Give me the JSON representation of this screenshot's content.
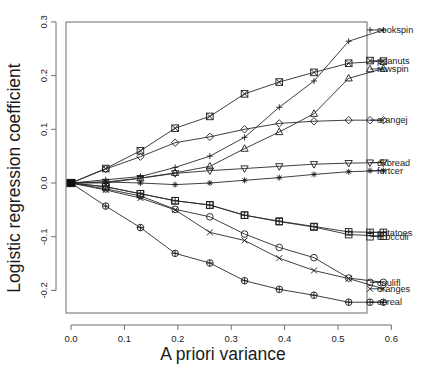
{
  "chart_data": {
    "type": "line",
    "title": "",
    "xlabel": "A priori variance",
    "ylabel": "Logistic regression coefficient",
    "xlim": [
      -0.035,
      0.655
    ],
    "ylim": [
      -0.245,
      0.305
    ],
    "xticks": [
      0.0,
      0.1,
      0.2,
      0.3,
      0.4,
      0.5,
      0.6
    ],
    "xticklabels": [
      "0.0",
      "0.1",
      "0.2",
      "0.3",
      "0.4",
      "0.5",
      "0.6"
    ],
    "yticks": [
      -0.2,
      -0.1,
      0.0,
      0.1,
      0.2,
      0.3
    ],
    "yticklabels": [
      "-0.2",
      "-0.1",
      "0.0",
      "0.1",
      "0.2",
      "0.3"
    ],
    "grid": false,
    "legend_position": "right-inline-labels",
    "x": [
      0.0,
      0.065,
      0.13,
      0.195,
      0.26,
      0.325,
      0.39,
      0.455,
      0.52,
      0.585
    ],
    "series": [
      {
        "name": "cookspin",
        "label": "cookspin",
        "marker": "plus",
        "label_y": 0.285,
        "values": [
          0.0,
          0.006,
          0.012,
          0.029,
          0.05,
          0.085,
          0.141,
          0.19,
          0.264,
          0.285
        ]
      },
      {
        "name": "peanuts",
        "label": "peanuts",
        "marker": "square-x",
        "label_y": 0.228,
        "values": [
          0.0,
          0.027,
          0.06,
          0.102,
          0.124,
          0.166,
          0.188,
          0.206,
          0.223,
          0.227
        ]
      },
      {
        "name": "rawspin",
        "label": "rawspin",
        "marker": "triangle-up",
        "label_y": 0.212,
        "values": [
          0.0,
          0.0,
          0.009,
          0.019,
          0.031,
          0.064,
          0.095,
          0.129,
          0.195,
          0.213
        ]
      },
      {
        "name": "orangej",
        "label": "orangej",
        "marker": "diamond",
        "label_y": 0.117,
        "values": [
          0.0,
          0.026,
          0.049,
          0.075,
          0.086,
          0.1,
          0.111,
          0.115,
          0.117,
          0.117
        ]
      },
      {
        "name": "dkbread",
        "label": "dkbread",
        "marker": "triangle-down",
        "label_y": 0.038,
        "values": [
          0.0,
          0.002,
          0.009,
          0.018,
          0.023,
          0.027,
          0.031,
          0.035,
          0.037,
          0.038
        ]
      },
      {
        "name": "fortcer",
        "label": "fortcer",
        "marker": "asterisk",
        "label_y": 0.023,
        "values": [
          0.0,
          0.002,
          0.0,
          -0.003,
          0.0,
          0.005,
          0.01,
          0.016,
          0.021,
          0.023
        ]
      },
      {
        "name": "potatoes",
        "label": "potatoes",
        "marker": "square-plus",
        "label_y": -0.092,
        "values": [
          0.0,
          -0.007,
          -0.02,
          -0.033,
          -0.041,
          -0.06,
          -0.071,
          -0.081,
          -0.091,
          -0.092
        ]
      },
      {
        "name": "broccoli",
        "label": "broccoli",
        "marker": "square",
        "label_y": -0.1,
        "values": [
          0.0,
          -0.007,
          -0.02,
          -0.033,
          -0.041,
          -0.06,
          -0.072,
          -0.082,
          -0.096,
          -0.099
        ]
      },
      {
        "name": "caulifl",
        "label": "caulifl",
        "marker": "circle",
        "label_y": -0.185,
        "values": [
          0.0,
          -0.011,
          -0.024,
          -0.049,
          -0.063,
          -0.095,
          -0.12,
          -0.139,
          -0.177,
          -0.185
        ]
      },
      {
        "name": "oranges",
        "label": "oranges",
        "marker": "cross",
        "label_y": -0.197,
        "values": [
          0.0,
          -0.013,
          -0.028,
          -0.05,
          -0.092,
          -0.107,
          -0.14,
          -0.163,
          -0.178,
          -0.197
        ]
      },
      {
        "name": "cereal",
        "label": "cereal",
        "marker": "circle-plus",
        "label_y": -0.222,
        "values": [
          0.0,
          -0.043,
          -0.083,
          -0.131,
          -0.149,
          -0.182,
          -0.198,
          -0.209,
          -0.222,
          -0.222
        ]
      }
    ]
  },
  "figure": {
    "background_color": "#ffffff",
    "line_color": "#2a2a2a",
    "frame_color": "#777777"
  }
}
